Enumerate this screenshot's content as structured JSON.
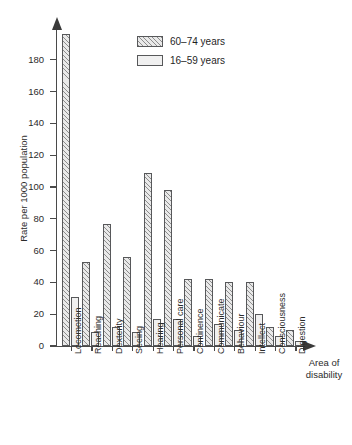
{
  "chart_data": {
    "type": "bar",
    "title": "",
    "xlabel": "Area of disability",
    "ylabel": "Rate per 1000 population",
    "ylim": [
      0,
      200
    ],
    "ytick_values": [
      0,
      20,
      40,
      60,
      80,
      100,
      120,
      140,
      160,
      180
    ],
    "ytick_labels": [
      "0",
      "20",
      "40",
      "60",
      "80",
      "100",
      "120",
      "140",
      "160",
      "180"
    ],
    "grid": false,
    "legend_position": "top-center",
    "categories": [
      "Locomotion",
      "Reaching",
      "Dexterity",
      "Seeing",
      "Hearing",
      "Personal care",
      "Continence",
      "Communicate",
      "Behaviour",
      "Intellect",
      "Consciousness",
      "Digestion"
    ],
    "series": [
      {
        "name": "60–74 years",
        "pattern": "hatched",
        "values": [
          196,
          53,
          77,
          56,
          109,
          98,
          42,
          42,
          40,
          40,
          12,
          10
        ]
      },
      {
        "name": "16–59 years",
        "pattern": "plain",
        "values": [
          31,
          9,
          12,
          9,
          17,
          17,
          6,
          14,
          10,
          20,
          6,
          3
        ]
      }
    ]
  },
  "legend": {
    "items": [
      {
        "label": "60–74 years"
      },
      {
        "label": "16–59 years"
      }
    ]
  },
  "axes": {
    "y_title": "Rate per 1000 population",
    "x_title": "Area of\ndisability",
    "x_title_line1": "Area of",
    "x_title_line2": "disability"
  }
}
